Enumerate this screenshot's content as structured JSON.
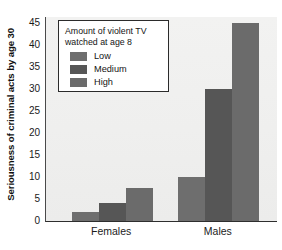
{
  "chart_data": {
    "type": "bar",
    "title": "",
    "subtitle": "",
    "xlabel": "",
    "ylabel": "Seriousness of criminal acts by age 30",
    "categories": [
      "Females",
      "Males"
    ],
    "series": [
      {
        "name": "Low",
        "values": [
          2,
          10
        ],
        "color": "#6e6e6e"
      },
      {
        "name": "Medium",
        "values": [
          4,
          30
        ],
        "color": "#565656"
      },
      {
        "name": "High",
        "values": [
          7.5,
          45
        ],
        "color": "#6b6b6b"
      }
    ],
    "ylim": [
      0,
      45
    ],
    "yticks": [
      0,
      5,
      10,
      15,
      20,
      25,
      30,
      35,
      40,
      45
    ],
    "ytick_labels": [
      "0",
      "5",
      "10",
      "15",
      "20",
      "25",
      "30",
      "35",
      "40",
      "45"
    ],
    "grid": false,
    "legend_position": "top-left",
    "legend_title": "Amount of violent TV\nwatched at age 8"
  },
  "legend": {
    "title": "Amount of violent TV\nwatched at age 8",
    "entries": [
      {
        "label": "Low",
        "color": "#6e6e6e"
      },
      {
        "label": "Medium",
        "color": "#565656"
      },
      {
        "label": "High",
        "color": "#6b6b6b"
      }
    ]
  },
  "axes": {
    "y_title": "Seriousness of criminal acts by age 30",
    "x_labels": [
      "Females",
      "Males"
    ]
  },
  "colors": {
    "plot_background": "#efefee",
    "axis_line": "#2e2e2e",
    "text": "#141414",
    "legend_background": "#ffffff",
    "legend_border": "#2b2b2b"
  }
}
